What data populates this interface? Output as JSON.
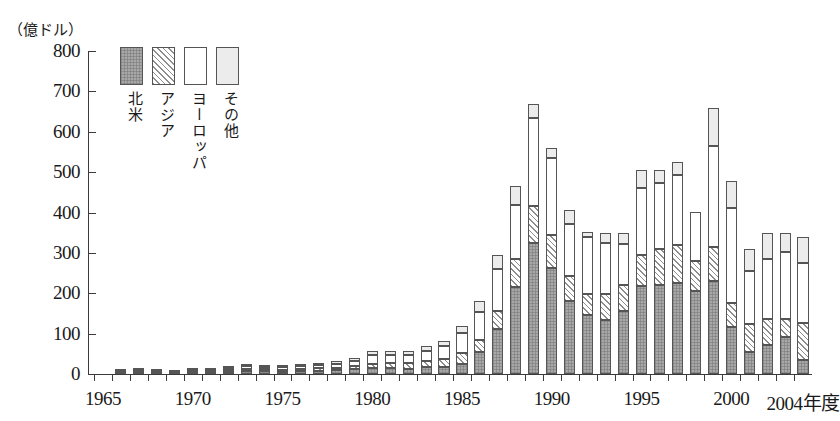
{
  "chart_data": {
    "type": "bar",
    "stacked": true,
    "title": "",
    "subtitle": "",
    "unit_label": "（億ドル）",
    "ylabel": "",
    "xlabel": "年度",
    "ylim": [
      0,
      800
    ],
    "ytick_labels": [
      "0",
      "100",
      "200",
      "300",
      "400",
      "500",
      "600",
      "700",
      "800"
    ],
    "ytick_values": [
      0,
      100,
      200,
      300,
      400,
      500,
      600,
      700,
      800
    ],
    "xtick_labels": [
      "1965",
      "1970",
      "1975",
      "1980",
      "1985",
      "1990",
      "1995",
      "2000",
      "2004年度"
    ],
    "xtick_years": [
      1965,
      1970,
      1975,
      1980,
      1985,
      1990,
      1995,
      2000,
      2004
    ],
    "grid": false,
    "legend_position": "top-left-inside",
    "categories": [
      1965,
      1966,
      1967,
      1968,
      1969,
      1970,
      1971,
      1972,
      1973,
      1974,
      1975,
      1976,
      1977,
      1978,
      1979,
      1980,
      1981,
      1982,
      1983,
      1984,
      1985,
      1986,
      1987,
      1988,
      1989,
      1990,
      1991,
      1992,
      1993,
      1994,
      1995,
      1996,
      1997,
      1998,
      1999,
      2000,
      2001,
      2002,
      2003,
      2004
    ],
    "series": [
      {
        "name": "北米",
        "color": "#a8a8a8",
        "pattern": "dotted-fill",
        "values": [
          0,
          2,
          4,
          3,
          2,
          4,
          3,
          5,
          7,
          7,
          6,
          7,
          8,
          9,
          12,
          15,
          14,
          13,
          17,
          18,
          26,
          54,
          112,
          216,
          324,
          262,
          180,
          145,
          135,
          155,
          217,
          221,
          226,
          205,
          230,
          116,
          55,
          73,
          91,
          35
        ]
      },
      {
        "name": "アジア",
        "color": "#ffffff",
        "pattern": "diagonal-hatch",
        "values": [
          0,
          2,
          2,
          2,
          2,
          3,
          3,
          4,
          5,
          5,
          5,
          5,
          6,
          7,
          9,
          11,
          13,
          14,
          16,
          19,
          27,
          30,
          43,
          70,
          91,
          82,
          64,
          54,
          63,
          65,
          79,
          89,
          93,
          74,
          84,
          59,
          70,
          63,
          45,
          92
        ]
      },
      {
        "name": "ヨーロッパ",
        "color": "#ffffff",
        "pattern": "solid-white",
        "values": [
          0,
          3,
          3,
          2,
          2,
          3,
          3,
          5,
          7,
          6,
          6,
          7,
          8,
          9,
          12,
          22,
          20,
          21,
          25,
          32,
          48,
          70,
          104,
          132,
          220,
          190,
          128,
          140,
          126,
          102,
          164,
          164,
          174,
          122,
          250,
          236,
          129,
          148,
          165,
          147
        ]
      },
      {
        "name": "その他",
        "color": "#ececec",
        "pattern": "light-fill",
        "values": [
          0,
          3,
          2,
          2,
          2,
          2,
          2,
          3,
          5,
          4,
          4,
          4,
          5,
          6,
          7,
          10,
          9,
          9,
          12,
          13,
          18,
          26,
          36,
          47,
          35,
          27,
          35,
          12,
          25,
          28,
          45,
          31,
          32,
          0,
          95,
          68,
          56,
          66,
          49,
          66
        ]
      }
    ],
    "totals": [
      0,
      10,
      11,
      9,
      8,
      12,
      11,
      17,
      24,
      22,
      21,
      23,
      27,
      31,
      40,
      58,
      56,
      57,
      70,
      82,
      119,
      180,
      295,
      465,
      670,
      561,
      407,
      351,
      349,
      350,
      505,
      505,
      525,
      401,
      659,
      479,
      310,
      350,
      350,
      340
    ]
  },
  "legend": {
    "items": [
      {
        "label": "北米",
        "swatch": "legend-swatch-north"
      },
      {
        "label": "アジア",
        "swatch": "legend-swatch-asia"
      },
      {
        "label": "ヨーロッパ",
        "swatch": "legend-swatch-europe"
      },
      {
        "label": "その他",
        "swatch": "legend-swatch-other"
      }
    ]
  }
}
